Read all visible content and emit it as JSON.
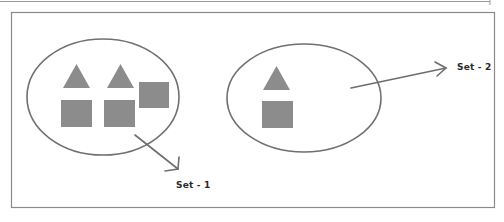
{
  "diagram": {
    "type": "set-diagram",
    "colors": {
      "background": "#ffffff",
      "frame": "#8a8a8a",
      "ellipse_stroke": "#707070",
      "shape_fill": "#8c8c8c",
      "arrow": "#6e6e6e",
      "label_text": "#2a2a2a"
    },
    "sets": [
      {
        "id": "set-1",
        "label": "Set - 1",
        "elements": [
          {
            "shape": "triangle"
          },
          {
            "shape": "triangle"
          },
          {
            "shape": "square"
          },
          {
            "shape": "square"
          },
          {
            "shape": "square"
          }
        ]
      },
      {
        "id": "set-2",
        "label": "Set - 2",
        "elements": [
          {
            "shape": "triangle"
          },
          {
            "shape": "square"
          }
        ]
      }
    ]
  }
}
